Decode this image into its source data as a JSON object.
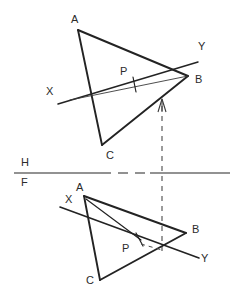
{
  "drawing": {
    "title": "Orthographic two-view projection of triangle ABC with point P",
    "ink_color": "#232323",
    "paper_color": "#ffffff",
    "reference_line": {
      "h_label": "H",
      "f_label": "F",
      "y": 173
    },
    "top_view": {
      "name": "horizontal-view",
      "vertices": [
        {
          "label": "A",
          "x": 78,
          "y": 30,
          "label_x": 71,
          "label_y": 18
        },
        {
          "label": "B",
          "x": 188,
          "y": 76,
          "label_x": 195,
          "label_y": 79
        },
        {
          "label": "C",
          "x": 102,
          "y": 145,
          "label_x": 107,
          "label_y": 152
        }
      ],
      "point_p": {
        "label": "P",
        "x": 134,
        "y": 83,
        "label_x": 121,
        "label_y": 68
      },
      "trace_line": {
        "start_label": "X",
        "end_label": "Y",
        "x1": 58,
        "y1": 104,
        "x2": 198,
        "y2": 62,
        "x_label_x": 47,
        "x_label_y": 88,
        "y_label_x": 199,
        "y_label_y": 44
      }
    },
    "front_view": {
      "name": "frontal-view",
      "vertices": [
        {
          "label": "A",
          "x": 84,
          "y": 196,
          "label_x": 77,
          "label_y": 184
        },
        {
          "label": "B",
          "x": 186,
          "y": 233,
          "label_x": 193,
          "label_y": 227
        },
        {
          "label": "C",
          "x": 100,
          "y": 280,
          "label_x": 87,
          "label_y": 277
        }
      ],
      "point_p": {
        "label": "P",
        "x": 140,
        "y": 243,
        "label_x": 124,
        "label_y": 245
      },
      "trace_line": {
        "start_label": "X",
        "end_label": "Y",
        "x1": 60,
        "y1": 207,
        "x2": 199,
        "y2": 258,
        "x_label_x": 66,
        "x_label_y": 196,
        "y_label_x": 202,
        "y_label_y": 255
      }
    },
    "projector": {
      "name": "vertical-projector",
      "x": 162,
      "y_top": 103,
      "y_bottom": 251,
      "style": "dashed",
      "arrow_at_top": true
    }
  }
}
